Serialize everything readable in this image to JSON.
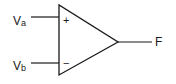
{
  "diagram": {
    "type": "op-amp comparator",
    "inputs": [
      {
        "label": "V",
        "subscript": "a",
        "terminal": "+"
      },
      {
        "label": "V",
        "subscript": "b",
        "terminal": "−"
      }
    ],
    "output": {
      "label": "F"
    },
    "colors": {
      "stroke": "#1a1a1a",
      "background": "#ffffff"
    }
  }
}
